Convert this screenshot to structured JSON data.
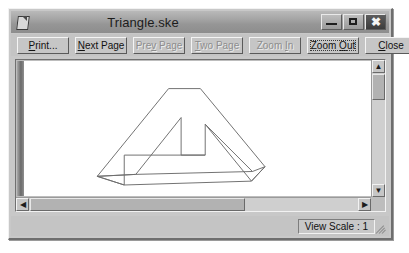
{
  "window": {
    "title": "Triangle.ske",
    "icon": "document-icon",
    "controls": {
      "minimize": "minimize-icon",
      "maximize": "maximize-icon",
      "close": "✖"
    }
  },
  "toolbar": {
    "buttons": [
      {
        "label": "Print...",
        "accel": "P",
        "enabled": true,
        "focused": false,
        "name": "print-button"
      },
      {
        "label": "Next Page",
        "accel": "N",
        "enabled": true,
        "focused": false,
        "name": "next-page-button"
      },
      {
        "label": "Prev Page",
        "accel": "v",
        "enabled": false,
        "focused": false,
        "name": "prev-page-button"
      },
      {
        "label": "Two Page",
        "accel": "T",
        "enabled": false,
        "focused": false,
        "name": "two-page-button"
      },
      {
        "label": "Zoom In",
        "accel": "I",
        "enabled": false,
        "focused": false,
        "name": "zoom-in-button"
      },
      {
        "label": "Zoom Out",
        "accel": "O",
        "enabled": true,
        "focused": true,
        "name": "zoom-out-button"
      },
      {
        "label": "Close",
        "accel": "C",
        "enabled": true,
        "focused": false,
        "name": "close-button"
      }
    ]
  },
  "document": {
    "drawing_name": "penrose-triangle",
    "caption": "More self-assembly furniture?"
  },
  "scrollbars": {
    "vertical": {
      "up": "▲",
      "down": "▼",
      "thumb_top_pct": 9,
      "thumb_size_pct": 18
    },
    "horizontal": {
      "left": "◀",
      "right": "▶",
      "thumb_left_pct": 4,
      "thumb_size_pct": 62
    }
  },
  "statusbar": {
    "view_scale": "View Scale : 1"
  },
  "colors": {
    "face": "#c4c4c4",
    "titlebar_start": "#b9b9b9",
    "titlebar_end": "#8d8d8d",
    "page": "#ffffff",
    "ink": "#6b6b6b"
  }
}
